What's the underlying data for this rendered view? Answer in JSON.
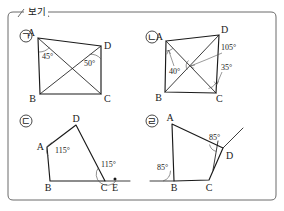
{
  "box": {
    "label": "보기",
    "border_color": "#6b6b6b",
    "background": "#ffffff"
  },
  "items": [
    {
      "mark": "㉠",
      "mark_char": "ㄱ",
      "vertices": [
        {
          "name": "A",
          "x": 38,
          "y": 38
        },
        {
          "name": "D",
          "x": 101,
          "y": 46
        },
        {
          "name": "C",
          "x": 101,
          "y": 94
        },
        {
          "name": "B",
          "x": 40,
          "y": 94
        }
      ],
      "diagonals": [
        "AC",
        "BD"
      ],
      "angles": [
        {
          "value": "45°",
          "at": "A",
          "between": "AB and AC"
        },
        {
          "value": "50°",
          "at": "D",
          "between": "DC and DB"
        }
      ]
    },
    {
      "mark": "㉡",
      "mark_char": "ㄴ",
      "vertices": [
        {
          "name": "A",
          "x": 166,
          "y": 41
        },
        {
          "name": "D",
          "x": 219,
          "y": 35
        },
        {
          "name": "C",
          "x": 216,
          "y": 93
        },
        {
          "name": "B",
          "x": 165,
          "y": 92
        }
      ],
      "diagonals": [
        "AC",
        "BD"
      ],
      "angles": [
        {
          "value": "40°",
          "at": "A",
          "between": "AB and AC"
        },
        {
          "value": "105°",
          "at": "diagonal intersection",
          "between": "AC and BD"
        },
        {
          "value": "35°",
          "at": "C",
          "between": "CB and CD"
        }
      ]
    },
    {
      "mark": "㉢",
      "mark_char": "ㄷ",
      "vertices": [
        {
          "name": "D",
          "x": 76,
          "y": 125
        },
        {
          "name": "A",
          "x": 47,
          "y": 147
        },
        {
          "name": "B",
          "x": 50,
          "y": 181
        },
        {
          "name": "C",
          "x": 105,
          "y": 181
        }
      ],
      "extension": {
        "from": "C",
        "through": "E",
        "to_x": 130
      },
      "extra_points": [
        {
          "name": "E",
          "x": 115,
          "y": 181,
          "dot": true
        }
      ],
      "angles": [
        {
          "value": "115°",
          "at": "A",
          "between": "AD and AB"
        },
        {
          "value": "115°",
          "at": "C",
          "between": "CD and CE"
        }
      ]
    },
    {
      "mark": "㉣",
      "mark_char": "ㄹ",
      "vertices": [
        {
          "name": "A",
          "x": 172,
          "y": 124
        },
        {
          "name": "D",
          "x": 223,
          "y": 148
        },
        {
          "name": "C",
          "x": 209,
          "y": 180
        },
        {
          "name": "B",
          "x": 174,
          "y": 181
        }
      ],
      "extensions": [
        {
          "line": "AD",
          "beyond": "D",
          "to_x": 243,
          "to_y": 128
        },
        {
          "line": "CB",
          "beyond": "B",
          "to_x": 150,
          "to_y": 181
        },
        {
          "line": "D-down",
          "to_x": 216,
          "to_y": 167
        }
      ],
      "angles": [
        {
          "value": "85°",
          "at": "D",
          "between": "DA and D-extension"
        },
        {
          "value": "85°",
          "at": "B",
          "between": "B-extension and BA"
        }
      ]
    }
  ],
  "labels": {
    "A": "A",
    "B": "B",
    "C": "C",
    "D": "D",
    "E": "E"
  }
}
